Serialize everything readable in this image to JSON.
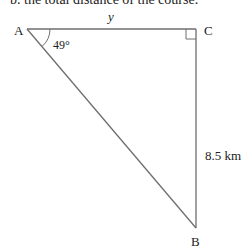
{
  "header": {
    "cut_off_text": "b. the total distance of the course."
  },
  "diagram": {
    "type": "right-triangle",
    "vertices": {
      "A": {
        "label": "A"
      },
      "B": {
        "label": "B"
      },
      "C": {
        "label": "C"
      }
    },
    "side_AC_label": "y",
    "side_CB_label": "8.5 km",
    "angle_A_label": "49°",
    "right_angle_at": "C",
    "line_color": "#6e6e6e"
  }
}
